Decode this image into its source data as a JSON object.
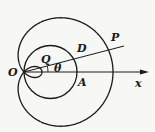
{
  "diagram": {
    "colors": {
      "stroke": "#1a1a1a",
      "background": "#f7f7f5"
    },
    "labels": {
      "O": "O",
      "Q": "Q",
      "theta": "θ",
      "D": "D",
      "A": "A",
      "P": "P",
      "x": "x"
    }
  }
}
